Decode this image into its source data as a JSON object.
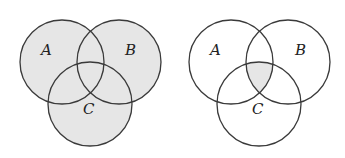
{
  "diagrams": [
    {
      "name": "venn-union",
      "shaded_region": "A ∪ B ∪ C",
      "labels": {
        "a": "A",
        "b": "B",
        "c": "C"
      },
      "fill_color": "#e6e6e6"
    },
    {
      "name": "venn-intersection",
      "shaded_region": "A ∩ B ∩ C",
      "labels": {
        "a": "A",
        "b": "B",
        "c": "C"
      },
      "fill_color": "#e6e6e6"
    }
  ],
  "colors": {
    "stroke": "#3a3a3a",
    "shade": "#e6e6e6",
    "background": "#ffffff"
  }
}
